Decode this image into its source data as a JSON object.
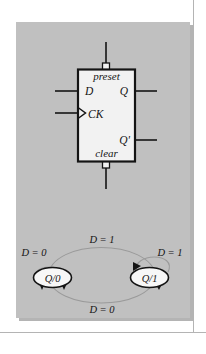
{
  "figure": {
    "panel_color": "#c0c0c0",
    "ink_color": "#141414",
    "box_fill": "#f2f2f2",
    "state_fill": "#f7f7f7",
    "frame_line_color": "#b8b8b8"
  },
  "flipflop": {
    "name": "d-flip-flop",
    "preset_label": "preset",
    "clear_label": "clear",
    "data_input_label": "D",
    "clock_input_label": "CK",
    "q_output_label": "Q",
    "qbar_output_label": "Q'",
    "preset_bubble": "inversion-bubble",
    "clear_bubble": "inversion-bubble",
    "clock_marker": "edge-trigger-triangle"
  },
  "state_diagram": {
    "name": "state-transition-diagram",
    "states": [
      {
        "id": "state-q0",
        "label": "Q/0"
      },
      {
        "id": "state-q1",
        "label": "Q/1"
      }
    ],
    "transitions": [
      {
        "id": "self-loop-left",
        "label": "D = 0",
        "from": "Q/0",
        "to": "Q/0"
      },
      {
        "id": "self-loop-right",
        "label": "D = 1",
        "from": "Q/1",
        "to": "Q/1"
      },
      {
        "id": "arc-top",
        "label": "D = 1",
        "from": "Q/0",
        "to": "Q/1"
      },
      {
        "id": "arc-bottom",
        "label": "D = 0",
        "from": "Q/1",
        "to": "Q/0"
      }
    ]
  }
}
